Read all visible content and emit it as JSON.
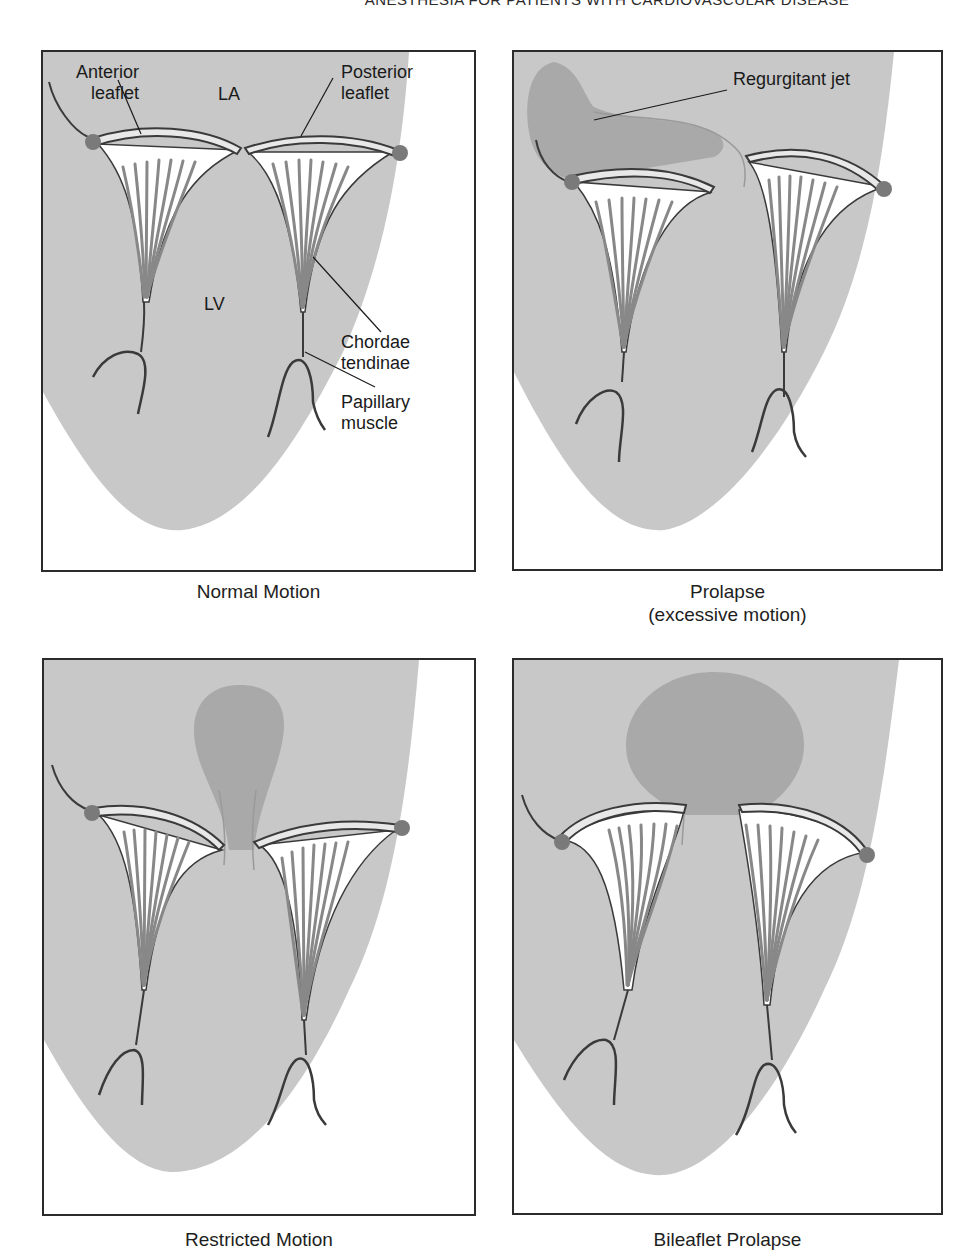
{
  "page_header": "ANESTHESIA FOR PATIENTS WITH CARDIOVASCULAR DISEASE",
  "colors": {
    "ventricle_fill": "#c8c8c8",
    "jet_fill": "#a9a9a9",
    "annulus_dot": "#7a7a7a",
    "leaflet_fill": "#ffffff",
    "outline": "#3a3a3a",
    "frame": "#2b2b2b"
  },
  "panels": [
    {
      "id": "normal",
      "caption": "Normal Motion",
      "labels": {
        "anterior_leaflet_1": "Anterior",
        "anterior_leaflet_2": "leaflet",
        "posterior_leaflet_1": "Posterior",
        "posterior_leaflet_2": "leaflet",
        "la": "LA",
        "lv": "LV",
        "chordae_1": "Chordae",
        "chordae_2": "tendinae",
        "papillary_1": "Papillary",
        "papillary_2": "muscle"
      }
    },
    {
      "id": "prolapse",
      "caption_line1": "Prolapse",
      "caption_line2": "(excessive motion)",
      "labels": {
        "jet": "Regurgitant jet"
      }
    },
    {
      "id": "restricted",
      "caption": "Restricted Motion"
    },
    {
      "id": "bileaflet",
      "caption": "Bileaflet Prolapse"
    }
  ]
}
